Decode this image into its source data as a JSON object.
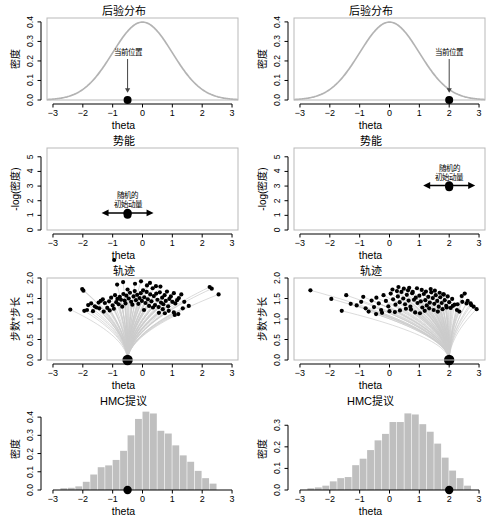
{
  "figure": {
    "width": 494,
    "height": 520,
    "background": "#ffffff",
    "curve_color": "#b3b3b3",
    "bar_color": "#bfbfbf",
    "point_color": "#000000",
    "frame_color": "#b9b9b9",
    "axis_color": "#000000"
  },
  "labels": {
    "xlabel": "theta",
    "ylabel_density": "密度",
    "ylabel_potential": "-log(密度)",
    "ylabel_trajectory": "步数*步长"
  },
  "annotations": {
    "current_position": "当前位置",
    "random_momentum_line1": "随机的",
    "random_momentum_line2": "初始动量"
  },
  "titles": {
    "posterior": "后验分布",
    "potential": "势能",
    "trajectory": "轨迹",
    "proposal": "HMC提议"
  },
  "chart_data": [
    {
      "id": "posterior-left",
      "type": "line",
      "title": "后验分布",
      "xlabel": "theta",
      "ylabel": "密度",
      "xlim": [
        -3.2,
        3.2
      ],
      "ylim": [
        0.0,
        0.42
      ],
      "xticks": [
        -3,
        -2,
        -1,
        0,
        1,
        2,
        3
      ],
      "yticks": [
        0.0,
        0.1,
        0.2,
        0.3,
        0.4
      ],
      "ytick_labels": [
        "0.0",
        "0.1",
        "0.2",
        "0.3",
        "0.4"
      ],
      "grid": false,
      "series": [
        {
          "name": "standard normal density",
          "description": "N(0,1) density curve",
          "mean": 0,
          "sd": 1,
          "peak": 0.399
        }
      ],
      "marker": {
        "label": "当前位置",
        "x": -0.5,
        "y": 0.0
      },
      "annotation": {
        "text": "当前位置",
        "arrow": "down",
        "x": -0.5
      }
    },
    {
      "id": "posterior-right",
      "type": "line",
      "title": "后验分布",
      "xlabel": "theta",
      "ylabel": "密度",
      "xlim": [
        -3.2,
        3.2
      ],
      "ylim": [
        0.0,
        0.42
      ],
      "xticks": [
        -3,
        -2,
        -1,
        0,
        1,
        2,
        3
      ],
      "yticks": [
        0.0,
        0.1,
        0.2,
        0.3,
        0.4
      ],
      "ytick_labels": [
        "0.0",
        "0.1",
        "0.2",
        "0.3",
        "0.4"
      ],
      "grid": false,
      "series": [
        {
          "name": "standard normal density",
          "description": "N(0,1) density curve",
          "mean": 0,
          "sd": 1,
          "peak": 0.399
        }
      ],
      "marker": {
        "label": "当前位置",
        "x": 2.0,
        "y": 0.0
      },
      "annotation": {
        "text": "当前位置",
        "arrow": "down",
        "x": 2.0
      }
    },
    {
      "id": "potential-left",
      "type": "line",
      "title": "势能",
      "xlabel": "theta",
      "ylabel": "-log(密度)",
      "xlim": [
        -3.2,
        3.2
      ],
      "ylim": [
        0,
        5.6
      ],
      "xticks": [
        -3,
        -2,
        -1,
        0,
        1,
        2,
        3
      ],
      "yticks": [
        0,
        1,
        2,
        3,
        4,
        5
      ],
      "ytick_labels": [
        "0",
        "1",
        "2",
        "3",
        "4",
        "5"
      ],
      "grid": false,
      "series": [
        {
          "name": "negative log density",
          "description": "U(theta) = 0.5*theta^2 + 0.919",
          "min_value": 0.919
        }
      ],
      "marker": {
        "x": -0.5,
        "y": 1.04
      },
      "annotation": {
        "text": "随机的 初始动量",
        "arrow": "double-horizontal",
        "x": -0.5
      }
    },
    {
      "id": "potential-right",
      "type": "line",
      "title": "势能",
      "xlabel": "theta",
      "ylabel": "-log(密度)",
      "xlim": [
        -3.2,
        3.2
      ],
      "ylim": [
        0,
        5.6
      ],
      "xticks": [
        -3,
        -2,
        -1,
        0,
        1,
        2,
        3
      ],
      "yticks": [
        0,
        1,
        2,
        3,
        4,
        5
      ],
      "ytick_labels": [
        "0",
        "1",
        "2",
        "3",
        "4",
        "5"
      ],
      "grid": false,
      "series": [
        {
          "name": "negative log density",
          "description": "U(theta) = 0.5*theta^2 + 0.919",
          "min_value": 0.919
        }
      ],
      "marker": {
        "x": 2.0,
        "y": 2.92
      },
      "annotation": {
        "text": "随机的 初始动量",
        "arrow": "double-horizontal",
        "x": 2.0
      }
    },
    {
      "id": "trajectory-left",
      "type": "scatter",
      "title": "轨迹",
      "xlabel": "theta",
      "ylabel": "步数*步长",
      "xlim": [
        -3.2,
        3.2
      ],
      "ylim": [
        0.0,
        2.0
      ],
      "xticks": [
        -3,
        -2,
        -1,
        0,
        1,
        2,
        3
      ],
      "yticks": [
        0.0,
        0.5,
        1.0,
        1.5,
        2.0
      ],
      "ytick_labels": [
        "0.0",
        "0.5",
        "1.0",
        "1.5",
        "2.0"
      ],
      "grid": false,
      "start_x": -0.5,
      "n_trajectories": 100,
      "endpoints_x": [
        -2.42,
        -2.02,
        -1.98,
        -1.95,
        -1.86,
        -1.82,
        -1.72,
        -1.66,
        -1.6,
        -1.54,
        -1.47,
        -1.4,
        -1.33,
        -1.26,
        -1.18,
        -1.12,
        -1.05,
        -1.0,
        -0.96,
        -0.92,
        -0.88,
        -0.84,
        -0.8,
        -0.76,
        -0.72,
        -0.68,
        -0.64,
        -0.6,
        -0.57,
        -0.54,
        -0.5,
        -0.46,
        -0.42,
        -0.38,
        -0.34,
        -0.3,
        -0.26,
        -0.22,
        -0.18,
        -0.14,
        -0.1,
        -0.06,
        -0.02,
        0.02,
        0.06,
        0.1,
        0.14,
        0.18,
        0.22,
        0.26,
        0.3,
        0.34,
        0.38,
        0.42,
        0.46,
        0.5,
        0.54,
        0.58,
        0.62,
        0.66,
        0.7,
        0.74,
        0.78,
        0.82,
        0.86,
        0.9,
        0.95,
        1.0,
        1.05,
        1.1,
        1.16,
        1.22,
        1.3,
        1.4,
        1.55,
        2.25,
        2.32,
        2.55,
        -1.45,
        -1.3,
        0.05,
        0.35,
        0.55,
        0.68,
        0.88,
        1.05,
        1.2,
        0.45,
        0.25,
        -0.05,
        -0.25,
        -0.65,
        -0.85,
        0.15,
        0.6,
        0.75,
        1.08,
        1.35,
        -1.1,
        -0.95
      ],
      "endpoints_y": [
        1.23,
        1.73,
        1.69,
        1.2,
        1.22,
        1.34,
        1.38,
        1.19,
        1.31,
        1.28,
        1.4,
        1.44,
        1.48,
        1.39,
        1.27,
        1.43,
        1.52,
        1.33,
        1.25,
        1.58,
        1.41,
        1.49,
        1.36,
        1.54,
        1.47,
        1.3,
        1.61,
        1.45,
        1.38,
        1.57,
        1.72,
        1.5,
        1.64,
        1.42,
        1.35,
        1.55,
        1.68,
        1.46,
        1.59,
        1.37,
        1.51,
        1.63,
        1.44,
        1.7,
        1.53,
        1.39,
        1.66,
        1.48,
        1.32,
        1.6,
        1.43,
        1.75,
        1.56,
        1.34,
        1.62,
        1.47,
        1.29,
        1.65,
        1.4,
        1.52,
        1.36,
        1.58,
        1.44,
        1.67,
        1.31,
        1.49,
        1.55,
        1.42,
        1.63,
        1.38,
        1.46,
        1.51,
        1.6,
        1.42,
        1.32,
        1.78,
        1.74,
        1.6,
        1.26,
        1.18,
        1.22,
        1.28,
        1.15,
        1.24,
        1.2,
        1.16,
        1.12,
        1.8,
        1.88,
        1.92,
        1.86,
        1.9,
        1.84,
        1.82,
        1.79,
        1.14,
        1.1,
        1.26,
        1.21
      ]
    },
    {
      "id": "trajectory-right",
      "type": "scatter",
      "title": "轨迹",
      "xlabel": "theta",
      "ylabel": "步数*步长",
      "xlim": [
        -3.2,
        3.2
      ],
      "ylim": [
        0.0,
        2.0
      ],
      "xticks": [
        -3,
        -2,
        -1,
        0,
        1,
        2,
        3
      ],
      "yticks": [
        0.0,
        0.5,
        1.0,
        1.5,
        2.0
      ],
      "ytick_labels": [
        "0.0",
        "0.5",
        "1.0",
        "1.5",
        "2.0"
      ],
      "grid": false,
      "start_x": 2.0,
      "n_trajectories": 100,
      "endpoints_x": [
        -2.65,
        -1.95,
        -1.6,
        -1.3,
        -1.1,
        -0.95,
        -0.8,
        -0.7,
        -0.6,
        -0.52,
        -0.44,
        -0.36,
        -0.28,
        -0.2,
        -0.12,
        -0.04,
        0.04,
        0.12,
        0.2,
        0.28,
        0.34,
        0.4,
        0.46,
        0.52,
        0.58,
        0.64,
        0.7,
        0.76,
        0.82,
        0.88,
        0.94,
        1.0,
        1.05,
        1.1,
        1.15,
        1.2,
        1.25,
        1.3,
        1.35,
        1.4,
        1.45,
        1.5,
        1.55,
        1.6,
        1.65,
        1.7,
        1.75,
        1.8,
        1.85,
        1.9,
        1.95,
        2.0,
        2.05,
        2.1,
        2.18,
        2.26,
        2.34,
        2.42,
        2.52,
        2.62,
        2.72,
        2.82,
        2.92,
        0.1,
        0.25,
        0.48,
        0.62,
        0.78,
        0.92,
        1.08,
        1.22,
        1.38,
        1.52,
        1.68,
        1.82,
        -0.45,
        -0.25,
        0.0,
        0.18,
        0.35,
        0.55,
        0.72,
        0.86,
        1.02,
        1.18,
        1.33,
        1.48,
        1.62,
        1.78,
        1.92,
        2.12,
        2.28,
        2.44,
        2.58,
        2.74,
        -1.45,
        -0.88,
        0.3,
        0.66
      ],
      "endpoints_y": [
        1.7,
        1.49,
        1.2,
        1.37,
        1.33,
        1.42,
        1.26,
        1.18,
        1.45,
        1.29,
        1.52,
        1.38,
        1.22,
        1.58,
        1.44,
        1.31,
        1.62,
        1.48,
        1.35,
        1.55,
        1.41,
        1.66,
        1.5,
        1.36,
        1.59,
        1.45,
        1.3,
        1.63,
        1.47,
        1.52,
        1.39,
        1.57,
        1.43,
        1.28,
        1.61,
        1.46,
        1.33,
        1.54,
        1.4,
        1.65,
        1.51,
        1.37,
        1.58,
        1.44,
        1.3,
        1.53,
        1.39,
        1.6,
        1.46,
        1.32,
        1.55,
        1.41,
        1.27,
        1.49,
        1.35,
        1.22,
        1.18,
        1.56,
        1.62,
        1.44,
        1.38,
        1.3,
        1.24,
        1.72,
        1.68,
        1.74,
        1.7,
        1.66,
        1.75,
        1.71,
        1.67,
        1.73,
        1.69,
        1.64,
        1.6,
        1.12,
        1.15,
        1.19,
        1.17,
        1.21,
        1.25,
        1.23,
        1.16,
        1.14,
        1.2,
        1.26,
        1.22,
        1.18,
        1.24,
        1.28,
        1.32,
        1.36,
        1.42,
        1.38,
        1.34,
        1.58,
        1.54,
        1.78,
        1.76
      ]
    },
    {
      "id": "proposal-left",
      "type": "bar",
      "title": "HMC提议",
      "xlabel": "theta",
      "ylabel": "密度",
      "xlim": [
        -3.2,
        3.2
      ],
      "ylim": [
        0.0,
        0.45
      ],
      "xticks": [
        -3,
        -2,
        -1,
        0,
        1,
        2,
        3
      ],
      "yticks": [
        0.0,
        0.1,
        0.2,
        0.3,
        0.4
      ],
      "ytick_labels": [
        "0.0",
        "0.1",
        "0.2",
        "0.3",
        "0.4"
      ],
      "grid": false,
      "bin_width": 0.25,
      "bin_starts": [
        -2.75,
        -2.5,
        -2.25,
        -2.0,
        -1.75,
        -1.5,
        -1.25,
        -1.0,
        -0.75,
        -0.5,
        -0.25,
        0.0,
        0.25,
        0.5,
        0.75,
        1.0,
        1.25,
        1.5,
        1.75,
        2.0,
        2.25
      ],
      "values": [
        0.01,
        0.012,
        0.02,
        0.045,
        0.085,
        0.125,
        0.135,
        0.165,
        0.215,
        0.3,
        0.39,
        0.43,
        0.42,
        0.325,
        0.31,
        0.245,
        0.19,
        0.155,
        0.105,
        0.065,
        0.035
      ],
      "marker": {
        "x": -0.5,
        "y": 0.0
      }
    },
    {
      "id": "proposal-right",
      "type": "bar",
      "title": "HMC提议",
      "xlabel": "theta",
      "ylabel": "密度",
      "xlim": [
        -3.2,
        3.2
      ],
      "ylim": [
        0.0,
        0.38
      ],
      "xticks": [
        -3,
        -2,
        -1,
        0,
        1,
        2,
        3
      ],
      "yticks": [
        0.0,
        0.1,
        0.2,
        0.3
      ],
      "ytick_labels": [
        "0.0",
        "0.1",
        "0.2",
        "0.3"
      ],
      "grid": false,
      "bin_width": 0.25,
      "bin_starts": [
        -2.75,
        -2.5,
        -2.25,
        -2.0,
        -1.75,
        -1.5,
        -1.25,
        -1.0,
        -0.75,
        -0.5,
        -0.25,
        0.0,
        0.25,
        0.5,
        0.75,
        1.0,
        1.25,
        1.5,
        1.75,
        2.0,
        2.25,
        2.5
      ],
      "values": [
        0.008,
        0.012,
        0.02,
        0.04,
        0.055,
        0.06,
        0.115,
        0.145,
        0.185,
        0.23,
        0.26,
        0.315,
        0.315,
        0.355,
        0.35,
        0.305,
        0.27,
        0.215,
        0.15,
        0.09,
        0.055,
        0.02
      ],
      "marker": {
        "x": 2.0,
        "y": 0.0
      }
    }
  ]
}
